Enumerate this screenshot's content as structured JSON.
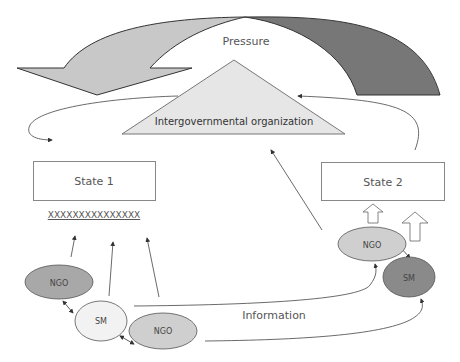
{
  "diagram": {
    "pressure_label": "Pressure",
    "igo_label": "Intergovernmental organization",
    "state1_label": "State 1",
    "state2_label": "State 2",
    "xxx_label": "XXXXXXXXXXXXXXX",
    "information_label": "Information",
    "nodes": {
      "ngo_left": "NGO",
      "sm_left": "SM",
      "ngo_bottom": "NGO",
      "ngo_right": "NGO",
      "sm_right": "SM"
    },
    "colors": {
      "arrow_light": "#c8c8c8",
      "arrow_dark": "#777777",
      "triangle": "#e6e6e6",
      "ngo_dark": "#a8a8a8",
      "sm_light": "#f2f2f2",
      "ngo_mid": "#cfcfcf",
      "sm_dark": "#8a8a8a"
    }
  }
}
